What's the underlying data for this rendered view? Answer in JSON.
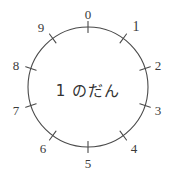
{
  "diagram": {
    "type": "number-dial",
    "title": "1 のだん",
    "center_label": "1 のだん",
    "background_color": "#ffffff",
    "stroke_color": "#4a4a4a",
    "text_color": "#3a3a3a",
    "circle": {
      "center_x": 88,
      "center_y": 87,
      "radius": 60
    },
    "tick_count": 10,
    "labels": [
      {
        "text": "0",
        "angle_deg": 0,
        "position": "top",
        "x": 88,
        "y": 14
      },
      {
        "text": "1",
        "angle_deg": 36,
        "position": "upper-right",
        "x": 136,
        "y": 27
      },
      {
        "text": "2",
        "angle_deg": 72,
        "position": "right-upper",
        "x": 158,
        "y": 65
      },
      {
        "text": "3",
        "angle_deg": 108,
        "position": "right-lower",
        "x": 158,
        "y": 110
      },
      {
        "text": "4",
        "angle_deg": 144,
        "position": "lower-right",
        "x": 134,
        "y": 148
      },
      {
        "text": "5",
        "angle_deg": 180,
        "position": "bottom",
        "x": 88,
        "y": 163
      },
      {
        "text": "6",
        "angle_deg": 216,
        "position": "lower-left",
        "x": 43,
        "y": 148
      },
      {
        "text": "7",
        "angle_deg": 252,
        "position": "left-lower",
        "x": 16,
        "y": 110
      },
      {
        "text": "8",
        "angle_deg": 288,
        "position": "left-upper",
        "x": 16,
        "y": 65
      },
      {
        "text": "9",
        "angle_deg": 324,
        "position": "upper-left",
        "x": 41,
        "y": 27
      }
    ]
  }
}
